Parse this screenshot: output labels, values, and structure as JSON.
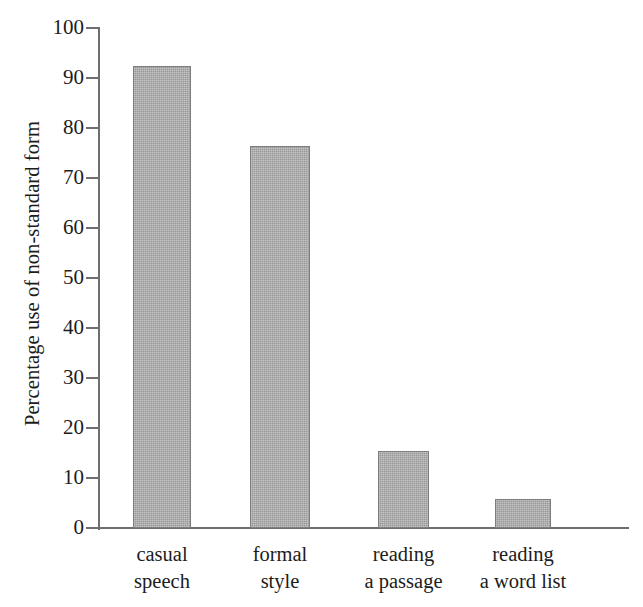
{
  "chart_data": {
    "type": "bar",
    "title": "",
    "subtitle": "",
    "xlabel": "",
    "ylabel": "Percentage use of non-standard form",
    "categories": [
      "casual speech",
      "formal style",
      "reading a passage",
      "reading a word list"
    ],
    "category_lines": [
      [
        "casual",
        "speech"
      ],
      [
        "formal",
        "style"
      ],
      [
        "reading",
        "a passage"
      ],
      [
        "reading",
        "a word list"
      ]
    ],
    "values": [
      92.5,
      76.5,
      15.5,
      5.8
    ],
    "ylim": [
      0,
      100
    ],
    "ytick_values": [
      0,
      10,
      20,
      30,
      40,
      50,
      60,
      70,
      80,
      90,
      100
    ],
    "ytick_labels": [
      "0",
      "10",
      "20",
      "30",
      "40",
      "50",
      "60",
      "70",
      "80",
      "90",
      "100"
    ],
    "grid": false,
    "legend": false,
    "legend_position": "none",
    "bar_fill_color": "#a9a9a9",
    "bar_edge_color": "#7d7d7d",
    "axis_color": "#6e6e6e",
    "text_color": "#1c1c1c",
    "background_color": "#ffffff"
  }
}
